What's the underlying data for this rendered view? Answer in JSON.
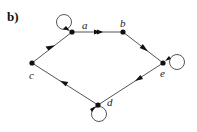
{
  "figure": {
    "label": "b)",
    "nodes": [
      {
        "id": "a",
        "label": "a",
        "x": 72,
        "y": 32,
        "self_loop": true
      },
      {
        "id": "b",
        "label": "b",
        "x": 123,
        "y": 32,
        "self_loop": false
      },
      {
        "id": "e",
        "label": "e",
        "x": 163,
        "y": 63,
        "self_loop": true
      },
      {
        "id": "d",
        "label": "d",
        "x": 98,
        "y": 105,
        "self_loop": true
      },
      {
        "id": "c",
        "label": "c",
        "x": 32,
        "y": 63,
        "self_loop": false
      }
    ],
    "edges": [
      {
        "from": "a",
        "to": "b"
      },
      {
        "from": "b",
        "to": "e"
      },
      {
        "from": "e",
        "to": "d"
      },
      {
        "from": "d",
        "to": "c"
      },
      {
        "from": "c",
        "to": "a"
      }
    ],
    "colors": {
      "edge": "#555555",
      "node": "#111111"
    }
  }
}
